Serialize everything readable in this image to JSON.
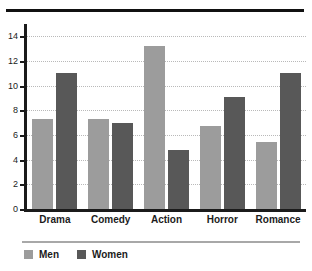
{
  "chart_data": {
    "type": "bar",
    "title": "",
    "xlabel": "",
    "ylabel": "",
    "categories": [
      "Drama",
      "Comedy",
      "Action",
      "Horror",
      "Romance"
    ],
    "series": [
      {
        "name": "Men",
        "color": "#9c9c9c",
        "values": [
          7.3,
          7.3,
          13.2,
          6.7,
          5.4
        ]
      },
      {
        "name": "Women",
        "color": "#585858",
        "values": [
          11.0,
          7.0,
          4.8,
          9.1,
          11.0
        ]
      }
    ],
    "ylim": [
      0,
      15
    ],
    "yticks": [
      0,
      2,
      4,
      6,
      8,
      10,
      12,
      14
    ],
    "ytick_labels": [
      "0",
      "2",
      "4",
      "6",
      "8",
      "10",
      "12",
      "14"
    ],
    "grid": true,
    "grid_axis": "y",
    "legend_position": "bottom-left"
  },
  "decorations": {
    "top_rule": "top-rule",
    "legend_rule": "legend-separator"
  }
}
